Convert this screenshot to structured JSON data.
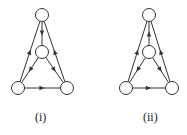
{
  "graphs": [
    {
      "label": "(i)",
      "nodes": {
        "top": [
          42,
          15
        ],
        "mid": [
          42,
          52
        ],
        "bl": [
          18,
          88
        ],
        "br": [
          67,
          88
        ]
      },
      "edges": [
        {
          "from": "top",
          "to": "mid"
        },
        {
          "from": "bl",
          "to": "top"
        },
        {
          "from": "br",
          "to": "top"
        },
        {
          "from": "mid",
          "to": "bl"
        },
        {
          "from": "mid",
          "to": "br"
        },
        {
          "from": "bl",
          "to": "br"
        }
      ]
    },
    {
      "label": "(ii)",
      "nodes": {
        "top": [
          149,
          15
        ],
        "mid": [
          149,
          52
        ],
        "bl": [
          126,
          88
        ],
        "br": [
          172,
          88
        ]
      },
      "edges": [
        {
          "from": "mid",
          "to": "top"
        },
        {
          "from": "bl",
          "to": "top"
        },
        {
          "from": "br",
          "to": "top"
        },
        {
          "from": "mid",
          "to": "bl"
        },
        {
          "from": "mid",
          "to": "br"
        },
        {
          "from": "bl",
          "to": "br"
        }
      ]
    }
  ],
  "style": {
    "stroke": "#333333",
    "node_radius": 6.5
  }
}
